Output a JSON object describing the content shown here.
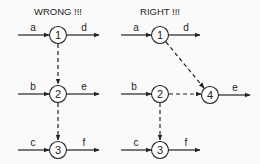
{
  "diagrams": [
    {
      "title": "WRONG !!!",
      "nodes": [
        {
          "id": "1",
          "label": "1"
        },
        {
          "id": "2",
          "label": "2"
        },
        {
          "id": "3",
          "label": "3"
        }
      ],
      "edges": [
        {
          "label": "a",
          "to": "1",
          "style": "solid"
        },
        {
          "label": "d",
          "from": "1",
          "style": "solid"
        },
        {
          "label": "b",
          "to": "2",
          "style": "solid"
        },
        {
          "label": "e",
          "from": "2",
          "style": "solid"
        },
        {
          "label": "c",
          "to": "3",
          "style": "solid"
        },
        {
          "label": "f",
          "from": "3",
          "style": "solid"
        },
        {
          "label": "",
          "from": "1",
          "to": "2",
          "style": "dashed"
        },
        {
          "label": "",
          "from": "2",
          "to": "3",
          "style": "dashed"
        }
      ]
    },
    {
      "title": "RIGHT !!!",
      "nodes": [
        {
          "id": "1",
          "label": "1"
        },
        {
          "id": "2",
          "label": "2"
        },
        {
          "id": "3",
          "label": "3"
        },
        {
          "id": "4",
          "label": "4"
        }
      ],
      "edges": [
        {
          "label": "a",
          "to": "1",
          "style": "solid"
        },
        {
          "label": "d",
          "from": "1",
          "style": "solid"
        },
        {
          "label": "b",
          "to": "2",
          "style": "solid"
        },
        {
          "label": "c",
          "to": "3",
          "style": "solid"
        },
        {
          "label": "f",
          "from": "3",
          "style": "solid"
        },
        {
          "label": "e",
          "from": "4",
          "style": "solid"
        },
        {
          "label": "",
          "from": "1",
          "to": "4",
          "style": "dashed"
        },
        {
          "label": "",
          "from": "2",
          "to": "4",
          "style": "dashed"
        },
        {
          "label": "",
          "from": "2",
          "to": "3",
          "style": "dashed"
        }
      ]
    }
  ]
}
